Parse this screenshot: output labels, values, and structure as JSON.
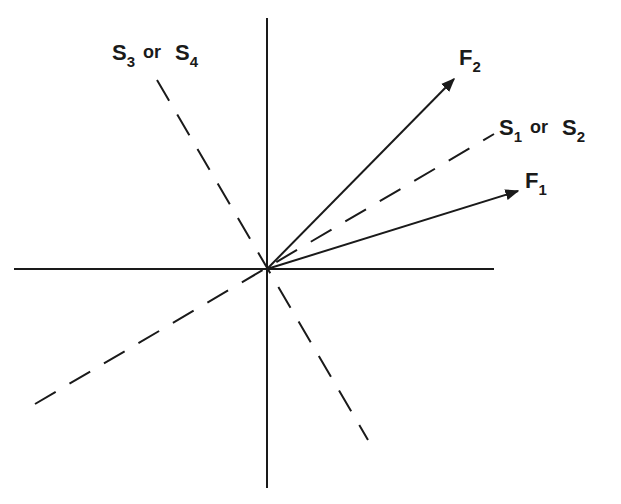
{
  "diagram": {
    "type": "vector-diagram",
    "axes": {
      "horizontal": "x-axis",
      "vertical": "y-axis"
    },
    "vectors": [
      {
        "id": "F1",
        "label": "F",
        "subscript": "1",
        "style": "solid-arrow"
      },
      {
        "id": "F2",
        "label": "F",
        "subscript": "2",
        "style": "solid-arrow"
      }
    ],
    "dashed_lines": [
      {
        "id": "S12",
        "label_a": "S",
        "sub_a": "1",
        "connector": "or",
        "label_b": "S",
        "sub_b": "2"
      },
      {
        "id": "S34",
        "label_a": "S",
        "sub_a": "3",
        "connector": "or",
        "label_b": "S",
        "sub_b": "4"
      }
    ],
    "colors": {
      "ink": "#1a1a1a",
      "background": "#ffffff"
    }
  }
}
